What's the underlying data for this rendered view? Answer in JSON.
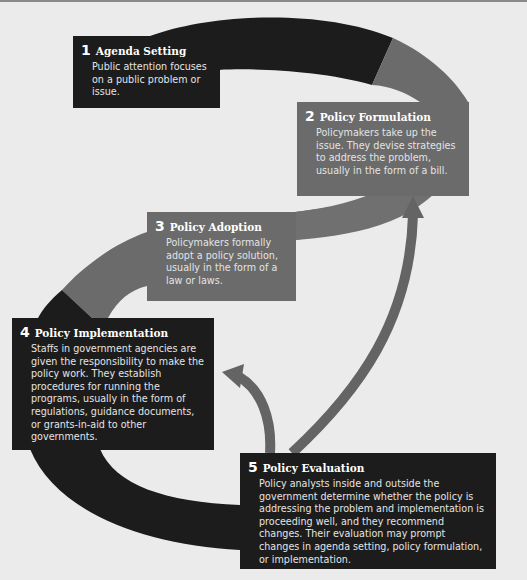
{
  "diagram": {
    "type": "policy-process-cycle",
    "colors": {
      "background": "#ebebeb",
      "dark_band": "#1c1c1c",
      "gray_band": "#6b6b6b",
      "arrow": "#646464",
      "text": "#f2f2f2"
    },
    "stages": [
      {
        "number": "1",
        "title": "Agenda Setting",
        "description": "Public attention focuses on a public problem or issue.",
        "tone": "dark"
      },
      {
        "number": "2",
        "title": "Policy Formulation",
        "description": "Policymakers take up the issue. They devise strategies to address the problem, usually in the form of a bill.",
        "tone": "gray"
      },
      {
        "number": "3",
        "title": "Policy Adoption",
        "description": "Policymakers formally adopt a policy solution, usually in the form of a law or laws.",
        "tone": "gray"
      },
      {
        "number": "4",
        "title": "Policy Implementation",
        "description": "Staffs in government agencies are given the responsibility to make the policy work. They establish procedures for running the programs, usually in the form of regulations, guidance documents, or grants-in-aid to other governments.",
        "tone": "dark"
      },
      {
        "number": "5",
        "title": "Policy Evaluation",
        "description": "Policy analysts inside and outside the government determine whether the policy is addressing the problem and implementation is proceeding well, and they recommend changes. Their evaluation may prompt changes in agenda setting, policy formulation, or implementation.",
        "tone": "dark"
      }
    ],
    "feedback_arrows": [
      {
        "from": "Policy Evaluation",
        "to": "Policy Implementation"
      },
      {
        "from": "Policy Evaluation",
        "to": "Policy Formulation"
      }
    ]
  }
}
